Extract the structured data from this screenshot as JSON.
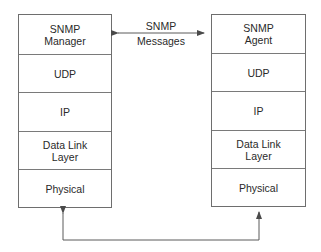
{
  "diagram": {
    "type": "protocol-stack-comparison",
    "left_stack": {
      "name": "manager",
      "layers": [
        {
          "label": "SNMP\nManager"
        },
        {
          "label": "UDP"
        },
        {
          "label": "IP"
        },
        {
          "label": "Data Link\nLayer"
        },
        {
          "label": "Physical"
        }
      ]
    },
    "right_stack": {
      "name": "agent",
      "layers": [
        {
          "label": "SNMP\nAgent"
        },
        {
          "label": "UDP"
        },
        {
          "label": "IP"
        },
        {
          "label": "Data Link\nLayer"
        },
        {
          "label": "Physical"
        }
      ]
    },
    "top_connector": {
      "label_line1": "SNMP",
      "label_line2": "Messages",
      "direction": "bidirectional"
    },
    "bottom_connector": {
      "direction": "bidirectional",
      "connects": "Physical-to-Physical"
    },
    "colors": {
      "line": "#6e6e6e",
      "text": "#2a2a2a",
      "background": "#ffffff"
    }
  }
}
